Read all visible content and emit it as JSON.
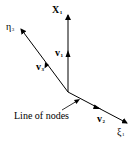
{
  "diagram": {
    "axes": {
      "x1": {
        "symbol": "X",
        "subscript": "1",
        "tip": [
          68,
          14
        ]
      },
      "eta3": {
        "symbol": "η",
        "subscript": "3",
        "tip": [
          20,
          28
        ]
      },
      "xi1": {
        "symbol": "ξ",
        "subscript": "1",
        "tip": [
          128,
          124
        ]
      }
    },
    "vectors": {
      "v1": {
        "symbol": "v",
        "subscript": "1"
      },
      "v2": {
        "symbol": "v",
        "subscript": "2"
      },
      "v3": {
        "symbol": "v",
        "subscript": "3"
      }
    },
    "annotation": {
      "text": "Line of nodes"
    },
    "origin": [
      68,
      92
    ],
    "line_color": "#000000"
  }
}
